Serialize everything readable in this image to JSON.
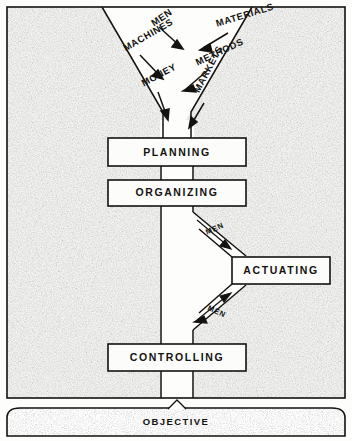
{
  "diagram": {
    "colors": {
      "ink": "#14120f",
      "paper": "#fdfdfc",
      "texture": "#8c8c8c",
      "box_fill": "#fbfbfa"
    },
    "inputs": [
      {
        "label": "MEN",
        "x": 152,
        "y": 18,
        "rotate": -34
      },
      {
        "label": "MATERIALS",
        "x": 216,
        "y": 18,
        "rotate": -17
      },
      {
        "label": "MACHINES",
        "x": 124,
        "y": 43,
        "rotate": -30
      },
      {
        "label": "METHODS",
        "x": 196,
        "y": 57,
        "rotate": -25
      },
      {
        "label": "MONEY",
        "x": 142,
        "y": 78,
        "rotate": -28
      },
      {
        "label": "MARKETS",
        "x": 196,
        "y": 86,
        "rotate": -62
      }
    ],
    "stages": [
      {
        "label": "PLANNING",
        "name": "planning",
        "x": 108,
        "y": 138,
        "w": 138,
        "h": 28
      },
      {
        "label": "ORGANIZING",
        "name": "organizing",
        "x": 108,
        "y": 180,
        "w": 138,
        "h": 26
      },
      {
        "label": "ACTUATING",
        "name": "actuating",
        "x": 232,
        "y": 257,
        "w": 98,
        "h": 27
      },
      {
        "label": "CONTROLLING",
        "name": "controlling",
        "x": 108,
        "y": 344,
        "w": 138,
        "h": 27
      }
    ],
    "flow_labels": [
      {
        "label": "MEN",
        "name": "men-flow-upper",
        "x": 206,
        "y": 228,
        "rotate": -24
      },
      {
        "label": "MEN",
        "name": "men-flow-lower",
        "x": 208,
        "y": 303,
        "rotate": 24
      }
    ],
    "objective": {
      "label": "OBJECTIVE",
      "x": 150,
      "y": 418
    },
    "frame": {
      "x": 7,
      "y": 7,
      "w": 338,
      "h": 391
    }
  }
}
